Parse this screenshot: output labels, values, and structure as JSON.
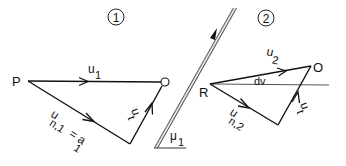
{
  "figure": {
    "panels": [
      {
        "id": "panel-1",
        "number": "1",
        "points": {
          "start": "P",
          "end": "O"
        },
        "vectors": [
          {
            "name": "u1",
            "base": "u",
            "sub": "1"
          },
          {
            "name": "un1",
            "base": "u",
            "sub": "n,1",
            "suffix": "= a",
            "suffix_sub": "1"
          },
          {
            "name": "ut",
            "base": "u",
            "sub": "t"
          }
        ]
      },
      {
        "id": "panel-2",
        "number": "2",
        "points": {
          "start": "R",
          "end": "O"
        },
        "angle_label": "dv",
        "vectors": [
          {
            "name": "u2",
            "base": "u",
            "sub": "2"
          },
          {
            "name": "un2",
            "base": "u",
            "sub": "n,2"
          },
          {
            "name": "ut",
            "base": "u",
            "sub": "t"
          }
        ]
      }
    ],
    "wall": {
      "angle_label_base": "μ",
      "angle_label_sub": "1"
    }
  },
  "colors": {
    "ink": "#111111",
    "wall": "#555555",
    "background": "#ffffff"
  }
}
